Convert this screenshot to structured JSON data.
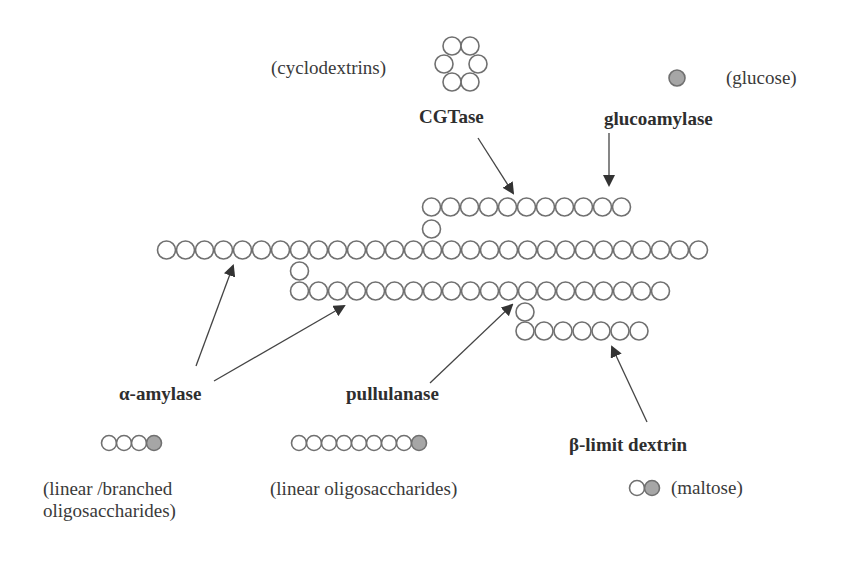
{
  "colors": {
    "circle_stroke": "#707070",
    "glucose_fill": "#a6a6a6",
    "arrow": "#333333",
    "text": "#3a3a3a"
  },
  "enzymes": {
    "cgtase": "CGTase",
    "glucoamylase": "glucoamylase",
    "alpha_amylase": "α-amylase",
    "pullulanase": "pullulanase",
    "beta_limit": "β-limit dextrin"
  },
  "products": {
    "cyclodextrins": "(cyclodextrins)",
    "glucose": "(glucose)",
    "linear_branched_line1": "(linear /branched",
    "linear_branched_line2": "oligosaccharides)",
    "linear_oligo": "(linear oligosaccharides)",
    "maltose": "(maltose)"
  },
  "chains": {
    "top_branch": {
      "x0": 431.5,
      "y": 207,
      "count": 11
    },
    "top_connector": {
      "x": 431.5,
      "y": 229
    },
    "main": {
      "x0": 166.5,
      "y": 250,
      "count": 29
    },
    "mid_connector": {
      "x": 299.5,
      "y": 271
    },
    "second": {
      "x0": 299.5,
      "y": 291,
      "count": 20
    },
    "low_connector": {
      "x": 525,
      "y": 312
    },
    "third": {
      "x0": 525,
      "y": 331,
      "count": 7
    },
    "pitch": 19,
    "radius": 9
  },
  "legend_chains": {
    "alpha_product": {
      "x0": 109,
      "y": 443,
      "open": 3,
      "filled": 1
    },
    "pullulanase_product": {
      "x0": 299,
      "y": 443,
      "open": 8,
      "filled": 1
    },
    "maltose": {
      "x0": 637,
      "y": 488,
      "open": 1,
      "filled": 1
    }
  },
  "cyclodextrin_ring": {
    "cx": 461,
    "cy": 66
  },
  "glucose_dot": {
    "cx": 677,
    "cy": 78
  }
}
